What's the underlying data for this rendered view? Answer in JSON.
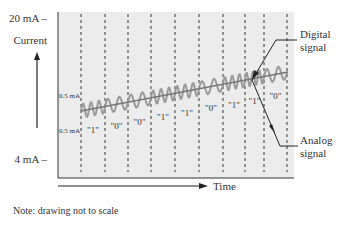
{
  "labels": {
    "y_top": "20 mA –",
    "y_bottom": "4 mA –",
    "y_axis": "Current",
    "x_axis": "Time",
    "amp_top": "0.5 mA",
    "amp_bottom": "0.5 mA",
    "digital": [
      "Digital",
      "signal"
    ],
    "analog": [
      "Analog",
      "signal"
    ],
    "note": "Note: drawing not to scale"
  },
  "bits": [
    "\"1\"",
    "\"0\"",
    "\"0\"",
    "\"1\"",
    "\"1\"",
    "\"0\"",
    "\"1\"",
    "\"1\"",
    "\"0\""
  ],
  "colors": {
    "panel": "#ececec",
    "wave": "#9a9a9a",
    "line": "#777777",
    "ink": "#222222"
  }
}
